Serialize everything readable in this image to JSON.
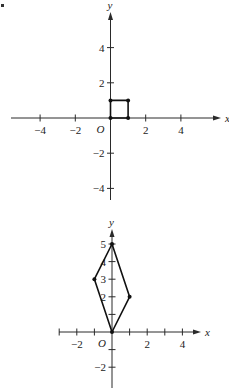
{
  "chart_data": [
    {
      "type": "line",
      "title": "",
      "xlabel": "x",
      "ylabel": "y",
      "origin_label": "O",
      "xlim": [
        -5.7,
        6.3
      ],
      "ylim": [
        -4.8,
        6.2
      ],
      "x_ticks": [
        -4,
        -2,
        2,
        4
      ],
      "x_tick_labels": [
        "−4",
        "−2",
        "2",
        "4"
      ],
      "y_ticks": [
        -4,
        -2,
        2,
        4
      ],
      "y_tick_labels": [
        "−4",
        "−2",
        "2",
        "4"
      ],
      "grid": false,
      "series": [
        {
          "name": "unit square",
          "closed": true,
          "points": [
            [
              0,
              0
            ],
            [
              1,
              0
            ],
            [
              1,
              1
            ],
            [
              0,
              1
            ]
          ]
        }
      ]
    },
    {
      "type": "line",
      "title": "",
      "xlabel": "x",
      "ylabel": "y",
      "origin_label": "O",
      "xlim": [
        -3,
        5
      ],
      "ylim": [
        -3.1,
        5.7
      ],
      "x_ticks": [
        -3,
        -2,
        -1,
        1,
        2,
        3,
        4
      ],
      "x_tick_labels": [
        "",
        "−2",
        "",
        "",
        "2",
        "",
        "4"
      ],
      "y_ticks": [
        -2,
        -1,
        1,
        2,
        3,
        4,
        5
      ],
      "y_tick_labels": [
        "−2",
        "",
        "",
        "2",
        "3",
        "4",
        "5"
      ],
      "grid": false,
      "series": [
        {
          "name": "transformed parallelogram",
          "closed": true,
          "points": [
            [
              0,
              0
            ],
            [
              1,
              2
            ],
            [
              0,
              5
            ],
            [
              -1,
              3
            ]
          ]
        }
      ]
    }
  ]
}
